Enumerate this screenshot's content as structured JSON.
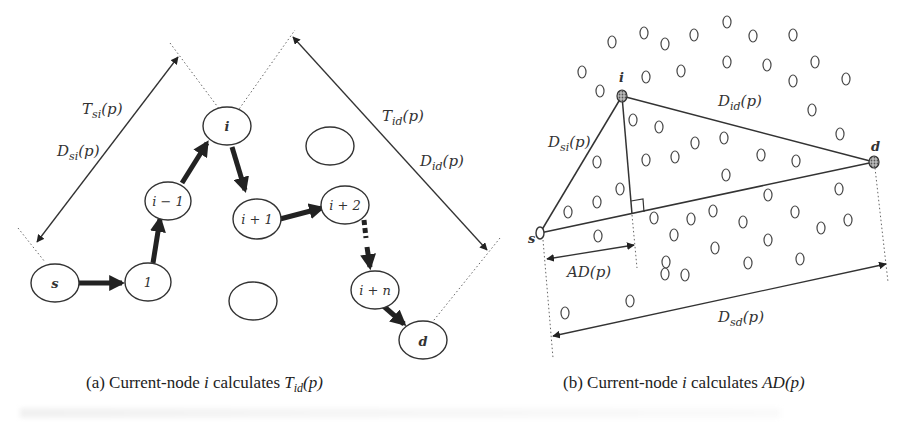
{
  "panel_a": {
    "nodes": {
      "s": "s",
      "n1": "1",
      "im1": "i − 1",
      "i": "i",
      "ip1": "i + 1",
      "ip2": "i + 2",
      "ipn": "i + n",
      "d": "d"
    },
    "labels": {
      "tsi_T": "T",
      "tsi_sub": "si",
      "dsi_D": "D",
      "dsi_sub": "si",
      "tid_T": "T",
      "tid_sub": "id",
      "did_D": "D",
      "did_sub": "id",
      "arg": "(p)"
    },
    "caption": {
      "prefix": "(a) Current-node ",
      "var": "i",
      "mid": " calculates ",
      "formula": "T",
      "sub": "id",
      "suffix": "(p)"
    }
  },
  "panel_b": {
    "nodes": {
      "s": "s",
      "i": "i",
      "d": "d"
    },
    "labels": {
      "dsi": "D",
      "dsi_sub": "si",
      "did": "D",
      "did_sub": "id",
      "ad": "AD",
      "dsd": "D",
      "dsd_sub": "sd",
      "arg": "(p)"
    },
    "caption": {
      "prefix": "(b) Current-node ",
      "var": "i",
      "mid": " calculates ",
      "formula": "AD",
      "suffix": "(p)"
    }
  }
}
